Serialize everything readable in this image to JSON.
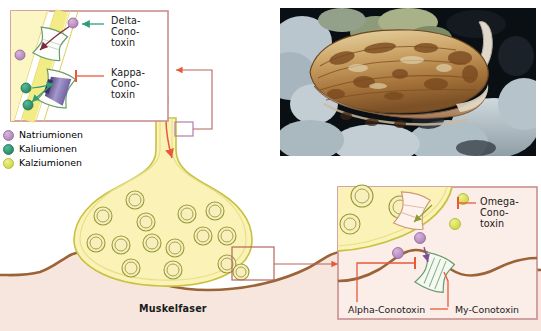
{
  "figure": {
    "kind": "neuromuscular-junction-conotoxin-diagram",
    "language": "de",
    "background_color": "#ffffff"
  },
  "legend": {
    "items": [
      {
        "label": "Natriumionen",
        "color": "#b98ec0",
        "ion": "sodium"
      },
      {
        "label": "Kaliumionen",
        "color": "#2f9e78",
        "ion": "potassium"
      },
      {
        "label": "Kalziumionen",
        "color": "#dbe24a",
        "ion": "calcium"
      }
    ]
  },
  "inset_top_left": {
    "name": "axon-membrane-channels-inset",
    "border_color": "#c98f8f",
    "background_color": "#ffffff",
    "membrane_color": "#f2ea7e",
    "cytoplasm_color": "#fbf5c4",
    "toxins": [
      {
        "name": "delta-conotoxin",
        "lines": [
          "Delta-",
          "Cono-",
          "toxin"
        ],
        "connector_color": "#2f9e78",
        "connector_type": "arrow",
        "target": "sodium-channel"
      },
      {
        "name": "kappa-conotoxin",
        "lines": [
          "Kappa-",
          "Cono-",
          "toxin"
        ],
        "connector_color": "#e8593a",
        "connector_type": "inhibit",
        "target": "potassium-channel"
      }
    ]
  },
  "inset_bottom_right": {
    "name": "synaptic-cleft-receptors-inset",
    "border_color": "#c98f8f",
    "background_color": "#fbeee8",
    "toxins": [
      {
        "name": "omega-conotoxin",
        "lines": [
          "Omega-",
          "Cono-",
          "toxin"
        ],
        "connector_color": "#e8593a",
        "connector_type": "inhibit",
        "target": "calcium-channel"
      },
      {
        "name": "alpha-conotoxin",
        "label": "Alpha-Conotoxin",
        "connector_color": "#e8593a",
        "connector_type": "inhibit",
        "target": "acetylcholine-receptor"
      },
      {
        "name": "my-conotoxin",
        "label": "My-Conotoxin",
        "connector_color": "#e8593a",
        "connector_type": "line",
        "target": "muscle-sodium-channel"
      }
    ]
  },
  "main_diagram": {
    "axon_terminal": {
      "name": "presynaptic-bouton",
      "fill_color": "#fbf2b8",
      "membrane_color": "#c8c23f",
      "vesicle_count": 15,
      "vesicle_fill": "#f7f0bd",
      "vesicle_ring": "#9a9a37"
    },
    "muscle_fiber": {
      "label": "Muskelfaser",
      "membrane_color": "#9a6338",
      "fill_color": "#f7e6de"
    },
    "signal_arrow": {
      "name": "action-potential-arrow",
      "color": "#e8593a",
      "direction": "down"
    },
    "connector_boxes": [
      {
        "name": "axon-zoom-box",
        "color": "#b07fa8"
      },
      {
        "name": "synapse-zoom-box",
        "color": "#b5655c"
      }
    ]
  },
  "photo": {
    "name": "cone-snail-photograph",
    "subject": "cone snail shell on coral reef",
    "shell_colors": [
      "#c9a36a",
      "#8a5a2c",
      "#e4d2a6",
      "#6b3c1c"
    ],
    "background_colors": [
      "#0c1218",
      "#c9d5dc",
      "#8a9aa2"
    ]
  }
}
